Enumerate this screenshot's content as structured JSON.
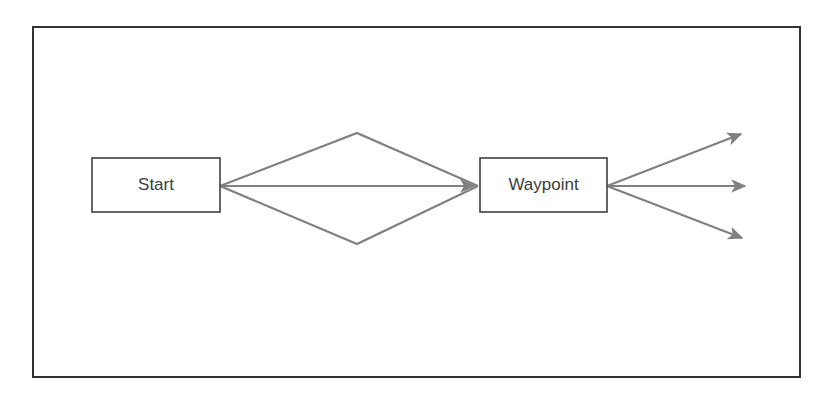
{
  "diagram": {
    "type": "flow-diagram",
    "frame": {
      "name": "outer-frame",
      "x": 33,
      "y": 27,
      "width": 767,
      "height": 350,
      "stroke": "#333333",
      "stroke_width": 2,
      "fill": "#ffffff"
    },
    "nodes": [
      {
        "id": "start",
        "label": "Start",
        "shape": "rectangle",
        "x": 92,
        "y": 158,
        "width": 128,
        "height": 54,
        "stroke": "#404040",
        "stroke_width": 1.6,
        "fill": "#ffffff",
        "label_color": "#3c3c3c"
      },
      {
        "id": "waypoint",
        "label": "Waypoint",
        "shape": "rectangle",
        "x": 480,
        "y": 158,
        "width": 127,
        "height": 54,
        "stroke": "#404040",
        "stroke_width": 1.6,
        "fill": "#ffffff",
        "label_color": "#3c3c3c"
      }
    ],
    "edges": [
      {
        "id": "start-to-waypoint-upper",
        "name": "edge-start-waypoint-upper",
        "from": "start",
        "to": "waypoint",
        "points": [
          [
            220,
            186
          ],
          [
            357,
            133
          ],
          [
            478,
            186
          ]
        ],
        "arrowhead": "none",
        "stroke": "#808080",
        "stroke_width": 2.2
      },
      {
        "id": "start-to-waypoint-middle",
        "name": "edge-start-waypoint-middle",
        "from": "start",
        "to": "waypoint",
        "points": [
          [
            220,
            186
          ],
          [
            474,
            186
          ]
        ],
        "arrowhead": "end",
        "stroke": "#808080",
        "stroke_width": 2.2
      },
      {
        "id": "start-to-waypoint-lower",
        "name": "edge-start-waypoint-lower",
        "from": "start",
        "to": "waypoint",
        "points": [
          [
            220,
            186
          ],
          [
            357,
            244
          ],
          [
            478,
            186
          ]
        ],
        "arrowhead": "none",
        "stroke": "#808080",
        "stroke_width": 2.2
      },
      {
        "id": "waypoint-out-upper",
        "name": "edge-waypoint-out-upper",
        "from": "waypoint",
        "to": null,
        "points": [
          [
            607,
            186
          ],
          [
            741,
            134
          ]
        ],
        "arrowhead": "end",
        "stroke": "#808080",
        "stroke_width": 2.2
      },
      {
        "id": "waypoint-out-middle",
        "name": "edge-waypoint-out-middle",
        "from": "waypoint",
        "to": null,
        "points": [
          [
            607,
            186
          ],
          [
            745,
            186
          ]
        ],
        "arrowhead": "end",
        "stroke": "#808080",
        "stroke_width": 2.2
      },
      {
        "id": "waypoint-out-lower",
        "name": "edge-waypoint-out-lower",
        "from": "waypoint",
        "to": null,
        "points": [
          [
            607,
            186
          ],
          [
            742,
            238
          ]
        ],
        "arrowhead": "end",
        "stroke": "#808080",
        "stroke_width": 2.2
      }
    ],
    "colors": {
      "frame_stroke": "#333333",
      "node_stroke": "#404040",
      "edge_stroke": "#808080",
      "text": "#3c3c3c",
      "background": "#ffffff"
    }
  }
}
